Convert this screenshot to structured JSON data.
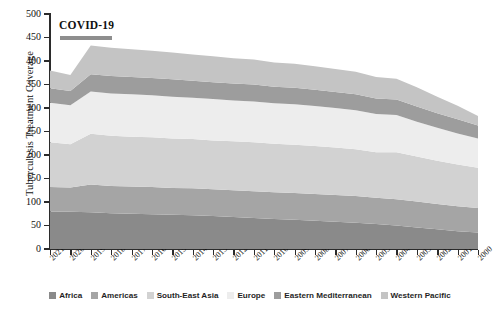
{
  "chart": {
    "type": "area",
    "ylabel": "Tuberculosis Treatment Coverage",
    "xlabel": "",
    "annotation": "COVID-19"
  },
  "chart_data": {
    "type": "area",
    "stacked": true,
    "title": "",
    "xlabel": "",
    "ylabel": "Tuberculosis Treatment Coverage",
    "ylim": [
      0,
      500
    ],
    "yticks": [
      0,
      50,
      100,
      150,
      200,
      250,
      300,
      350,
      400,
      450,
      500
    ],
    "grid": false,
    "legend_position": "bottom",
    "annotations": [
      {
        "text": "COVID-19",
        "x": "2021-2020",
        "note": "horizontal marker bar spanning the 2021-2020 period near y=455"
      }
    ],
    "categories": [
      "2021",
      "2020",
      "2019",
      "2018",
      "2017",
      "2016",
      "2015",
      "2014",
      "2013",
      "2012",
      "2011",
      "2010",
      "2009",
      "2008",
      "2007",
      "2006",
      "2005",
      "2004",
      "2003",
      "2002",
      "2001",
      "2000"
    ],
    "series": [
      {
        "name": "Africa",
        "color": "#8a8a8a",
        "values": [
          80,
          79,
          78,
          76,
          75,
          74,
          73,
          72,
          70,
          68,
          66,
          64,
          62,
          60,
          58,
          56,
          53,
          50,
          46,
          42,
          38,
          35
        ]
      },
      {
        "name": "Americas",
        "color": "#a5a5a5",
        "values": [
          52,
          52,
          59,
          58,
          58,
          58,
          57,
          57,
          57,
          57,
          57,
          57,
          57,
          57,
          57,
          57,
          56,
          56,
          55,
          54,
          53,
          52
        ]
      },
      {
        "name": "South-East Asia",
        "color": "#d2d2d2",
        "values": [
          95,
          92,
          108,
          107,
          106,
          106,
          105,
          105,
          104,
          104,
          104,
          103,
          103,
          102,
          101,
          99,
          97,
          100,
          96,
          92,
          89,
          86
        ]
      },
      {
        "name": "Europe",
        "color": "#ededed",
        "values": [
          84,
          83,
          90,
          90,
          90,
          89,
          89,
          88,
          88,
          87,
          87,
          86,
          86,
          85,
          84,
          83,
          81,
          79,
          74,
          70,
          66,
          62
        ]
      },
      {
        "name": "Eastern Mediterranean",
        "color": "#9d9d9d",
        "values": [
          31,
          30,
          37,
          37,
          37,
          37,
          37,
          36,
          36,
          36,
          36,
          35,
          35,
          35,
          34,
          34,
          33,
          33,
          32,
          31,
          30,
          28
        ]
      },
      {
        "name": "Western Pacific",
        "color": "#c4c4c4",
        "values": [
          38,
          34,
          61,
          60,
          59,
          58,
          57,
          56,
          55,
          54,
          53,
          52,
          51,
          50,
          49,
          48,
          46,
          44,
          41,
          35,
          29,
          20
        ]
      }
    ],
    "totals": [
      380,
      370,
      433,
      428,
      425,
      422,
      418,
      414,
      410,
      406,
      403,
      397,
      394,
      389,
      383,
      377,
      366,
      362,
      344,
      324,
      305,
      283
    ]
  },
  "legend": {
    "items": [
      {
        "label": "Africa",
        "color": "#8a8a8a"
      },
      {
        "label": "Americas",
        "color": "#a5a5a5"
      },
      {
        "label": "South-East Asia",
        "color": "#d2d2d2"
      },
      {
        "label": "Europe",
        "color": "#ededed"
      },
      {
        "label": "Eastern Mediterranean",
        "color": "#9d9d9d"
      },
      {
        "label": "Western Pacific",
        "color": "#c4c4c4"
      }
    ]
  }
}
